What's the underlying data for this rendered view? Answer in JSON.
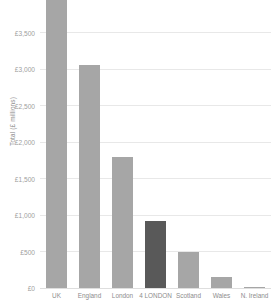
{
  "chart_data": {
    "type": "bar",
    "title": "",
    "subtitle": "",
    "xlabel": "",
    "ylabel": "Total (£ millions)",
    "categories": [
      "UK",
      "England",
      "London",
      "4 LONDON",
      "Scotland",
      "Wales",
      "N. Ireland"
    ],
    "values": [
      3950,
      3050,
      1800,
      920,
      490,
      155,
      10
    ],
    "series": [
      {
        "name": "Total (£ millions)",
        "values": [
          3950,
          3050,
          1800,
          920,
          490,
          155,
          10
        ]
      }
    ],
    "bar_colors": [
      "#a6a6a6",
      "#a6a6a6",
      "#a6a6a6",
      "#595959",
      "#a6a6a6",
      "#a6a6a6",
      "#a6a6a6"
    ],
    "highlight_category": "4 LONDON",
    "ylim": [
      0,
      3950
    ],
    "ytick_values": [
      0,
      500,
      1000,
      1500,
      2000,
      2500,
      3000,
      3500
    ],
    "ytick_labels": [
      "£0",
      "£500",
      "£1,000",
      "£1,500",
      "£2,000",
      "£2,500",
      "£3,000",
      "£3,500"
    ],
    "grid": true,
    "grid_axis": "y",
    "legend": false,
    "legend_position": "none",
    "colors": {
      "bar_default": "#a6a6a6",
      "bar_accent": "#595959",
      "gridline": "#e8e8e8",
      "axis_text": "#8d8d8d",
      "tick_text": "#a0a0a0",
      "background": "#ffffff"
    }
  }
}
